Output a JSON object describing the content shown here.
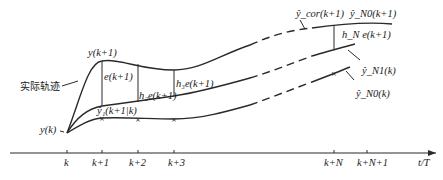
{
  "diagram": {
    "type": "prediction-correction trajectory diagram",
    "labels": {
      "actual_trajectory": "实际轨迹",
      "y_k": "y(k)",
      "y_k1": "y(k+1)",
      "e_k1": "e(k+1)",
      "h2e": "h₂e(k+1)",
      "h3e": "h₃e(k+1)",
      "hNe": "h_N e(k+1)",
      "y1_pred": "ŷ₁(k+1|k)",
      "ycor": "ŷ_cor(k+1)",
      "arrow": "→",
      "yN0_k1": "ŷ_N0(k+1)",
      "yN1_k": "ŷ_N1(k)",
      "yN0_k": "ŷ_N0(k)"
    },
    "axis": {
      "ticks": [
        "k",
        "k+1",
        "k+2",
        "k+3",
        "k+N",
        "k+N+1"
      ],
      "xlabel": "t/T"
    }
  }
}
